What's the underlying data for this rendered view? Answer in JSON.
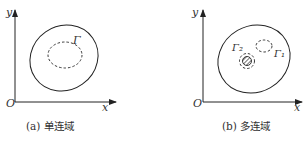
{
  "figure": {
    "panels": [
      {
        "id": "a",
        "caption": "(a) 单连域",
        "axis_x_label": "x",
        "axis_y_label": "y",
        "origin_label": "O",
        "curves": [
          {
            "label": "",
            "style": "solid",
            "role": "outer-boundary"
          },
          {
            "label": "Γ",
            "style": "dashed",
            "role": "inner-contour"
          }
        ]
      },
      {
        "id": "b",
        "caption": "(b) 多连域",
        "axis_x_label": "x",
        "axis_y_label": "y",
        "origin_label": "O",
        "curves": [
          {
            "label": "",
            "style": "solid",
            "role": "outer-boundary"
          },
          {
            "label": "Γ₁",
            "style": "dashed",
            "role": "contractible-contour"
          },
          {
            "label": "Γ₂",
            "style": "dashed",
            "role": "contour-around-hole"
          },
          {
            "label": "",
            "style": "hatched",
            "role": "hole"
          }
        ]
      }
    ]
  },
  "colors": {
    "line": "#222222",
    "background": "#ffffff"
  }
}
